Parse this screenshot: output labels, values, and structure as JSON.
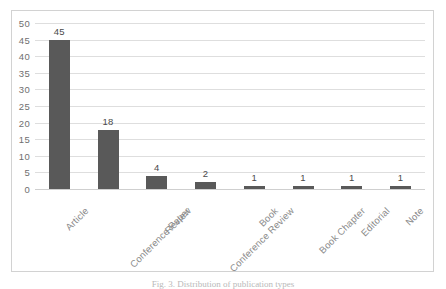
{
  "caption": "Fig. 3. Distribution of publication types",
  "chart_data": {
    "type": "bar",
    "title": "",
    "xlabel": "",
    "ylabel": "",
    "categories": [
      "Article",
      "Conference Paper",
      "Review",
      "Conference Review",
      "Book",
      "Book Chapter",
      "Editorial",
      "Note"
    ],
    "values": [
      45,
      18,
      4,
      2,
      1,
      1,
      1,
      1
    ],
    "data_labels": [
      "45",
      "18",
      "4",
      "2",
      "1",
      "1",
      "1",
      "1"
    ],
    "ylim": [
      0,
      50
    ],
    "yticks": [
      0,
      5,
      10,
      15,
      20,
      25,
      30,
      35,
      40,
      45,
      50
    ],
    "ytick_labels": [
      "0",
      "5",
      "10",
      "15",
      "20",
      "25",
      "30",
      "35",
      "40",
      "45",
      "50"
    ],
    "grid": true,
    "legend": false,
    "legend_position": "none",
    "bar_color": "#595959",
    "gridline_color": "#dedede",
    "tick_label_color": "#6f6f6f",
    "category_label_color": "#8a8a8a",
    "category_label_rotation": -45,
    "frame_border_color": "#d2d2d2",
    "background_color": "#ffffff"
  }
}
